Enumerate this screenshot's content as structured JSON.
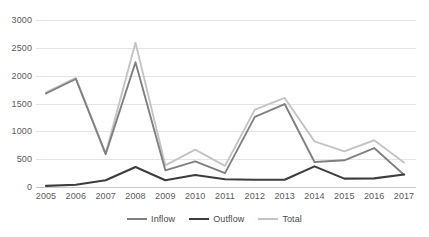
{
  "chart_data": {
    "type": "line",
    "title": "",
    "xlabel": "",
    "ylabel": "",
    "x": [
      2005,
      2006,
      2007,
      2008,
      2009,
      2010,
      2011,
      2012,
      2013,
      2014,
      2015,
      2016,
      2017
    ],
    "categories": [
      "2005",
      "2006",
      "2007",
      "2008",
      "2009",
      "2010",
      "2011",
      "2012",
      "2013",
      "2014",
      "2015",
      "2016",
      "2017"
    ],
    "series": [
      {
        "name": "Inflow",
        "color": "#808080",
        "values": [
          1680,
          1940,
          590,
          2240,
          300,
          460,
          250,
          1260,
          1490,
          450,
          480,
          700,
          220
        ]
      },
      {
        "name": "Outflow",
        "color": "#3d3d3d",
        "values": [
          20,
          40,
          120,
          360,
          120,
          215,
          140,
          130,
          130,
          370,
          150,
          155,
          225
        ]
      },
      {
        "name": "Total",
        "color": "#c4c4c4",
        "values": [
          1700,
          1960,
          600,
          2590,
          390,
          670,
          380,
          1390,
          1600,
          820,
          640,
          840,
          440
        ]
      }
    ],
    "ylim": [
      0,
      3000
    ],
    "yticks": [
      0,
      500,
      1000,
      1500,
      2000,
      2500,
      3000
    ],
    "ytick_labels": [
      "0",
      "500",
      "1000",
      "1500",
      "2000",
      "2500",
      "3000"
    ],
    "grid": true,
    "legend_position": "bottom",
    "legend_entries": [
      "Inflow",
      "Outflow",
      "Total"
    ],
    "annotations": [],
    "axis_colors": {
      "gridline": "#e4e4e4",
      "tick_text": "#5a5a5a",
      "background": "#ffffff"
    }
  },
  "legend": {
    "items": [
      {
        "label": "Inflow"
      },
      {
        "label": "Outflow"
      },
      {
        "label": "Total"
      }
    ]
  }
}
